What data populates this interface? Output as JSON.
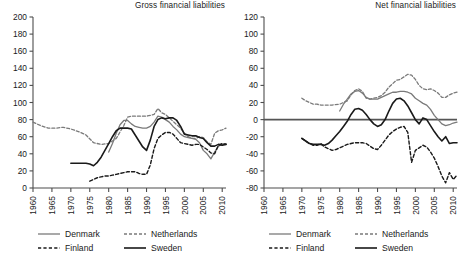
{
  "figure": {
    "width": 462,
    "height": 258,
    "background": "#ffffff"
  },
  "series_styles": {
    "Denmark": {
      "color": "#7a7a7a",
      "dash": "none",
      "width": 1.3
    },
    "Netherlands": {
      "color": "#7a7a7a",
      "dash": "3,2",
      "width": 1.3
    },
    "Finland": {
      "color": "#1a1a1a",
      "dash": "3.2,2.2",
      "width": 1.4
    },
    "Sweden": {
      "color": "#1a1a1a",
      "dash": "none",
      "width": 1.6
    }
  },
  "legend": {
    "entries": [
      {
        "label": "Denmark",
        "style": "solid-gray"
      },
      {
        "label": "Netherlands",
        "style": "dotted-gray"
      },
      {
        "label": "Finland",
        "style": "dashed-black"
      },
      {
        "label": "Sweden",
        "style": "solid-black"
      }
    ]
  },
  "chart_data": [
    {
      "id": "gross",
      "type": "line",
      "title": "Gross financial liabilities",
      "xlabel": "",
      "ylabel": "",
      "xlim": [
        1960,
        2011
      ],
      "ylim": [
        0,
        200
      ],
      "ytick_step": 20,
      "yticks": [
        0,
        20,
        40,
        60,
        80,
        100,
        120,
        140,
        160,
        180,
        200
      ],
      "xticks": [
        1960,
        1965,
        1970,
        1975,
        1980,
        1985,
        1990,
        1995,
        2000,
        2005,
        2010
      ],
      "grid": false,
      "legend_position": "below",
      "series": [
        {
          "name": "Denmark",
          "x": [
            1980,
            1981,
            1982,
            1983,
            1984,
            1985,
            1986,
            1987,
            1988,
            1989,
            1990,
            1991,
            1992,
            1993,
            1994,
            1995,
            1996,
            1997,
            1998,
            1999,
            2000,
            2001,
            2002,
            2003,
            2004,
            2005,
            2006,
            2007,
            2008,
            2009,
            2010,
            2011
          ],
          "values": [
            42,
            52,
            64,
            74,
            79,
            79,
            75,
            72,
            71,
            70,
            70,
            72,
            77,
            84,
            83,
            80,
            77,
            72,
            68,
            63,
            60,
            59,
            58,
            57,
            53,
            44,
            40,
            34,
            42,
            49,
            51,
            52
          ]
        },
        {
          "name": "Netherlands",
          "x": [
            1960,
            1962,
            1964,
            1966,
            1968,
            1970,
            1972,
            1974,
            1976,
            1978,
            1980,
            1982,
            1984,
            1985,
            1986,
            1988,
            1990,
            1992,
            1993,
            1994,
            1995,
            1996,
            1997,
            1998,
            1999,
            2000,
            2001,
            2002,
            2003,
            2004,
            2005,
            2006,
            2007,
            2008,
            2009,
            2010,
            2011
          ],
          "values": [
            77,
            73,
            70,
            70,
            71,
            69,
            66,
            62,
            53,
            51,
            52,
            58,
            73,
            83,
            84,
            84,
            84,
            86,
            93,
            88,
            86,
            82,
            78,
            74,
            70,
            64,
            60,
            58,
            58,
            60,
            59,
            54,
            51,
            64,
            67,
            68,
            70
          ]
        },
        {
          "name": "Finland",
          "x": [
            1975,
            1976,
            1977,
            1978,
            1979,
            1980,
            1981,
            1982,
            1983,
            1984,
            1985,
            1986,
            1987,
            1988,
            1989,
            1990,
            1991,
            1992,
            1993,
            1994,
            1995,
            1996,
            1997,
            1998,
            1999,
            2000,
            2001,
            2002,
            2003,
            2004,
            2005,
            2006,
            2007,
            2008,
            2009,
            2010,
            2011
          ],
          "values": [
            8,
            10,
            12,
            13,
            14,
            14,
            15,
            16,
            17,
            18,
            19,
            19,
            19,
            17,
            16,
            16,
            27,
            46,
            58,
            62,
            65,
            65,
            63,
            58,
            53,
            52,
            51,
            50,
            51,
            51,
            48,
            45,
            41,
            40,
            50,
            52,
            51
          ]
        },
        {
          "name": "Sweden",
          "x": [
            1970,
            1971,
            1972,
            1973,
            1974,
            1975,
            1976,
            1977,
            1978,
            1979,
            1980,
            1981,
            1982,
            1983,
            1984,
            1985,
            1986,
            1987,
            1988,
            1989,
            1990,
            1991,
            1992,
            1993,
            1994,
            1995,
            1996,
            1997,
            1998,
            1999,
            2000,
            2001,
            2002,
            2003,
            2004,
            2005,
            2006,
            2007,
            2008,
            2009,
            2010,
            2011
          ],
          "values": [
            29,
            29,
            29,
            29,
            29,
            28,
            26,
            30,
            36,
            44,
            52,
            60,
            67,
            70,
            70,
            70,
            69,
            62,
            55,
            48,
            44,
            56,
            72,
            80,
            82,
            81,
            82,
            82,
            79,
            72,
            63,
            62,
            61,
            61,
            59,
            58,
            53,
            49,
            49,
            51,
            50,
            51
          ]
        }
      ]
    },
    {
      "id": "net",
      "type": "line",
      "title": "Net financial liabilities",
      "xlabel": "",
      "ylabel": "",
      "xlim": [
        1960,
        2011
      ],
      "ylim": [
        -80,
        120
      ],
      "ytick_step": 20,
      "yticks": [
        -80,
        -60,
        -40,
        -20,
        0,
        20,
        40,
        60,
        80,
        100,
        120
      ],
      "xticks": [
        1960,
        1965,
        1970,
        1975,
        1980,
        1985,
        1990,
        1995,
        2000,
        2005,
        2010
      ],
      "grid": false,
      "zero_line": 0,
      "legend_position": "below",
      "series": [
        {
          "name": "Denmark",
          "x": [
            1980,
            1981,
            1982,
            1983,
            1984,
            1985,
            1986,
            1987,
            1988,
            1989,
            1990,
            1991,
            1992,
            1993,
            1994,
            1995,
            1996,
            1997,
            1998,
            1999,
            2000,
            2001,
            2002,
            2003,
            2004,
            2005,
            2006,
            2007,
            2008,
            2009,
            2010,
            2011
          ],
          "values": [
            10,
            18,
            24,
            30,
            33,
            34,
            31,
            26,
            24,
            24,
            24,
            26,
            28,
            30,
            32,
            32,
            33,
            33,
            32,
            30,
            25,
            22,
            19,
            17,
            12,
            5,
            0,
            -5,
            -7,
            -6,
            -4,
            -3
          ]
        },
        {
          "name": "Netherlands",
          "x": [
            1970,
            1971,
            1972,
            1973,
            1974,
            1975,
            1976,
            1977,
            1978,
            1980,
            1982,
            1983,
            1984,
            1985,
            1986,
            1987,
            1988,
            1989,
            1990,
            1991,
            1992,
            1993,
            1994,
            1995,
            1996,
            1997,
            1998,
            1999,
            2000,
            2001,
            2002,
            2003,
            2004,
            2005,
            2006,
            2007,
            2008,
            2009,
            2010,
            2011
          ],
          "values": [
            25,
            22,
            20,
            18,
            18,
            17,
            17,
            17,
            17,
            18,
            22,
            29,
            34,
            36,
            33,
            25,
            24,
            25,
            26,
            28,
            32,
            38,
            42,
            46,
            47,
            50,
            53,
            52,
            47,
            40,
            36,
            35,
            36,
            34,
            31,
            26,
            26,
            29,
            31,
            32
          ]
        },
        {
          "name": "Finland",
          "x": [
            1970,
            1971,
            1972,
            1973,
            1974,
            1975,
            1976,
            1977,
            1978,
            1979,
            1980,
            1981,
            1982,
            1983,
            1984,
            1985,
            1986,
            1987,
            1988,
            1989,
            1990,
            1991,
            1992,
            1993,
            1994,
            1995,
            1996,
            1997,
            1998,
            1999,
            2000,
            2001,
            2002,
            2003,
            2004,
            2005,
            2006,
            2007,
            2008,
            2009,
            2010,
            2011
          ],
          "values": [
            -22,
            -25,
            -28,
            -30,
            -30,
            -28,
            -32,
            -34,
            -36,
            -35,
            -33,
            -31,
            -29,
            -28,
            -27,
            -27,
            -27,
            -28,
            -31,
            -34,
            -35,
            -30,
            -24,
            -18,
            -14,
            -11,
            -9,
            -8,
            -15,
            -50,
            -36,
            -33,
            -30,
            -32,
            -38,
            -45,
            -55,
            -66,
            -74,
            -62,
            -70,
            -65
          ]
        },
        {
          "name": "Sweden",
          "x": [
            1970,
            1971,
            1972,
            1973,
            1974,
            1975,
            1976,
            1977,
            1978,
            1979,
            1980,
            1981,
            1982,
            1983,
            1984,
            1985,
            1986,
            1987,
            1988,
            1989,
            1990,
            1991,
            1992,
            1993,
            1994,
            1995,
            1996,
            1997,
            1998,
            1999,
            2000,
            2001,
            2002,
            2003,
            2004,
            2005,
            2006,
            2007,
            2008,
            2009,
            2010,
            2011
          ],
          "values": [
            -22,
            -25,
            -28,
            -29,
            -29,
            -29,
            -30,
            -28,
            -24,
            -19,
            -14,
            -8,
            -2,
            6,
            12,
            13,
            11,
            6,
            0,
            -5,
            -8,
            -6,
            0,
            10,
            19,
            24,
            25,
            22,
            16,
            8,
            0,
            -5,
            2,
            0,
            -7,
            -14,
            -20,
            -25,
            -20,
            -28,
            -27,
            -27
          ]
        }
      ]
    }
  ]
}
